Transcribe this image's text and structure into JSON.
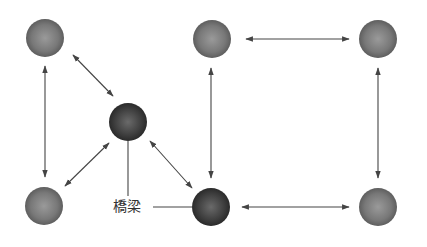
{
  "diagram": {
    "title": "",
    "bridge_label": "橋梁",
    "colors": {
      "node_light": "#7a7a7a",
      "node_dark": "#3c3c3c",
      "edge": "#444444",
      "label": "#333333"
    },
    "nodes": [
      {
        "id": "top-left",
        "x": 45,
        "y": 38,
        "type": "normal"
      },
      {
        "id": "bridge",
        "x": 128,
        "y": 122,
        "type": "bridge"
      },
      {
        "id": "bottom-left",
        "x": 44,
        "y": 206,
        "type": "normal"
      },
      {
        "id": "top-middle",
        "x": 212,
        "y": 39,
        "type": "normal"
      },
      {
        "id": "top-right",
        "x": 378,
        "y": 39,
        "type": "normal"
      },
      {
        "id": "bottom-middle",
        "x": 211,
        "y": 207,
        "type": "bridge"
      },
      {
        "id": "bottom-right",
        "x": 378,
        "y": 207,
        "type": "normal"
      }
    ],
    "edges": [
      {
        "from": "top-left",
        "to": "bottom-left",
        "direction": "bidirectional"
      },
      {
        "from": "top-left",
        "to": "bridge",
        "direction": "bidirectional"
      },
      {
        "from": "bottom-left",
        "to": "bridge",
        "direction": "bidirectional"
      },
      {
        "from": "bridge",
        "to": "bottom-middle",
        "direction": "bidirectional"
      },
      {
        "from": "top-middle",
        "to": "bottom-middle",
        "direction": "bidirectional"
      },
      {
        "from": "top-middle",
        "to": "top-right",
        "direction": "bidirectional"
      },
      {
        "from": "top-right",
        "to": "bottom-right",
        "direction": "bidirectional"
      },
      {
        "from": "bottom-middle",
        "to": "bottom-right",
        "direction": "bidirectional"
      }
    ]
  }
}
